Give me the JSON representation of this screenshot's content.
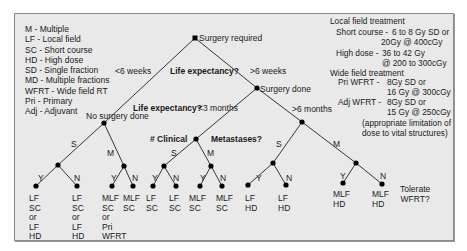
{
  "legend": {
    "items": [
      "M - Multiple",
      "LF - Local field",
      "SC - Short course",
      "HD - High dose",
      "SD - Single fraction",
      "MD - Multiple fractions",
      "WFRT - Wide field RT",
      "Pri - Primary",
      "Adj - Adjuvant"
    ]
  },
  "treatment": {
    "local_title": "Local field treatment",
    "short_course_label": "Short course -",
    "short_course_line1": "6 to 8 Gy SD or",
    "short_course_line2": "20Gy @ 400cGy",
    "high_dose_label": "High dose -",
    "high_dose_line1": "36 to 42 Gy",
    "high_dose_line2": "@ 200 to 300cGy",
    "wide_title": "Wide field treatment",
    "pri_label": "Pri WFRT -",
    "pri_line1": "8Gy SD or",
    "pri_line2": "16 Gy @ 300cGy",
    "adj_label": "Adj WFRT -",
    "adj_line1": "8Gy SD or",
    "adj_line2": "15 Gy @ 250cGy",
    "note_line1": "(appropriate limitation of",
    "note_line2": "dose to vital structures)"
  },
  "tree": {
    "root": "Surgery required",
    "q_life1": "Life expectancy?",
    "lt6weeks": "<6 weeks",
    "gt6weeks": ">6 weeks",
    "no_surgery": "No surgery done",
    "surgery_done": "Surgery done",
    "q_life2": "Life expectancy?",
    "lt3months": "<3 months",
    "gt6months": ">6 months",
    "q_clinical": "# Clinical",
    "q_metastases": "Metastases?",
    "branch_s": "S",
    "branch_m": "M",
    "yes": "Y",
    "no": "N",
    "tolerate": "Tolerate",
    "wfrt_q": "WFRT?"
  },
  "leaves": [
    [
      "LF",
      "SC",
      "or",
      "LF",
      "HD"
    ],
    [
      "LF",
      "SC",
      "or",
      "LF",
      "HD"
    ],
    [
      "MLF",
      "SC",
      "or",
      "Pri",
      "WFRT"
    ],
    [
      "MLF",
      "SC"
    ],
    [
      "LF",
      "SC"
    ],
    [
      "LF",
      "SC"
    ],
    [
      "MLF",
      "SC"
    ],
    [
      "MLF",
      "SC"
    ],
    [
      "LF",
      "HD"
    ],
    [
      "LF",
      "HD"
    ],
    [
      "MLF",
      "HD"
    ],
    [
      "MLF",
      "HD"
    ]
  ]
}
